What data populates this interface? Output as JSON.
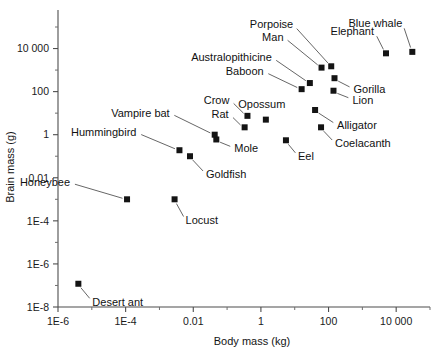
{
  "chart_data": {
    "type": "scatter",
    "title": "",
    "xlabel": "Body mass (kg)",
    "ylabel": "Brain mass (g)",
    "xscale": "log",
    "yscale": "log",
    "xlim": [
      1e-06,
      100000
    ],
    "ylim": [
      1e-08,
      100000
    ],
    "grid": false,
    "legend": "none",
    "xticks": [
      "1E-6",
      "1E-4",
      "0.01",
      "1",
      "100",
      "10 000"
    ],
    "xtick_values": [
      1e-06,
      0.0001,
      0.01,
      1,
      100,
      10000
    ],
    "yticks": [
      "1E-8",
      "1E-6",
      "1E-4",
      "0.01",
      "1",
      "100",
      "10 000"
    ],
    "ytick_values": [
      1e-08,
      1e-06,
      0.0001,
      0.01,
      1,
      100,
      10000
    ],
    "points": [
      {
        "label": "Desert ant",
        "x": 4e-06,
        "y": 1.2e-07,
        "label_dx": 14,
        "label_dy": 22,
        "anchor": "start"
      },
      {
        "label": "Honeybee",
        "x": 0.00011,
        "y": 0.001,
        "label_dx": -57,
        "label_dy": -13,
        "anchor": "end"
      },
      {
        "label": "Locust",
        "x": 0.0028,
        "y": 0.001,
        "label_dx": 11,
        "label_dy": 25,
        "anchor": "start"
      },
      {
        "label": "Hummingbird",
        "x": 0.0039,
        "y": 0.19,
        "label_dx": -43,
        "label_dy": -14,
        "anchor": "end"
      },
      {
        "label": "Goldfish",
        "x": 0.008,
        "y": 0.1,
        "label_dx": 16,
        "label_dy": 22,
        "anchor": "start"
      },
      {
        "label": "Mole",
        "x": 0.048,
        "y": 0.6,
        "label_dx": 18,
        "label_dy": 13,
        "anchor": "start"
      },
      {
        "label": "Vampire bat",
        "x": 0.043,
        "y": 1.0,
        "label_dx": -45,
        "label_dy": -18,
        "anchor": "end"
      },
      {
        "label": "Rat",
        "x": 0.33,
        "y": 2.2,
        "label_dx": -16,
        "label_dy": -9,
        "anchor": "end"
      },
      {
        "label": "Crow",
        "x": 0.4,
        "y": 7.5,
        "label_dx": -18,
        "label_dy": -12,
        "anchor": "end"
      },
      {
        "label": "Opossum",
        "x": 1.4,
        "y": 5.0,
        "label_dx": -4,
        "label_dy": -12,
        "anchor": "middle"
      },
      {
        "label": "Eel",
        "x": 5.5,
        "y": 0.55,
        "label_dx": 12,
        "label_dy": 20,
        "anchor": "start"
      },
      {
        "label": "Baboon",
        "x": 16,
        "y": 130,
        "label_dx": -38,
        "label_dy": -14,
        "anchor": "end"
      },
      {
        "label": "Australopithicine",
        "x": 28,
        "y": 250,
        "label_dx": -38,
        "label_dy": -22,
        "anchor": "end"
      },
      {
        "label": "Man",
        "x": 62,
        "y": 1300,
        "label_dx": -38,
        "label_dy": -27,
        "anchor": "end"
      },
      {
        "label": "Porpoise",
        "x": 120,
        "y": 1500,
        "label_dx": -38,
        "label_dy": -38,
        "anchor": "end"
      },
      {
        "label": "Gorilla",
        "x": 150,
        "y": 420,
        "label_dx": 19,
        "label_dy": 15,
        "anchor": "start"
      },
      {
        "label": "Lion",
        "x": 140,
        "y": 110,
        "label_dx": 19,
        "label_dy": 13,
        "anchor": "start"
      },
      {
        "label": "Coelacanth",
        "x": 60,
        "y": 2.2,
        "label_dx": 14,
        "label_dy": 20,
        "anchor": "start"
      },
      {
        "label": "Alligator",
        "x": 40,
        "y": 14,
        "label_dx": 22,
        "label_dy": 19,
        "anchor": "start"
      },
      {
        "label": "Elephant",
        "x": 5000,
        "y": 6000,
        "label_dx": -12,
        "label_dy": -18,
        "anchor": "end"
      },
      {
        "label": "Blue whale",
        "x": 30000,
        "y": 7000,
        "label_dx": -10,
        "label_dy": -25,
        "anchor": "end"
      }
    ]
  }
}
